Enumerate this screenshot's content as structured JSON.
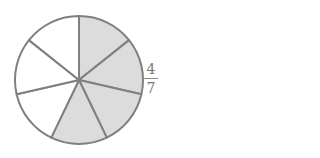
{
  "diagram": {
    "type": "fraction-circle",
    "total_parts": 7,
    "shaded_parts": 4,
    "shaded_indices": [
      0,
      1,
      2,
      3
    ],
    "colors": {
      "shaded": "#dcdcdc",
      "unshaded": "#ffffff",
      "stroke": "#808080"
    },
    "label": {
      "numerator": "4",
      "denominator": "7"
    }
  }
}
